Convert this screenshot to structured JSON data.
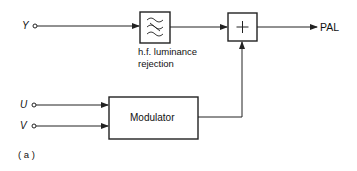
{
  "diagram": {
    "inputs": {
      "y": "Y",
      "u": "U",
      "v": "V"
    },
    "blocks": {
      "filter": {
        "symbol": "filter-icon",
        "caption_line1": "h.f. luminance",
        "caption_line2": "rejection"
      },
      "summer": {
        "symbol": "+"
      },
      "modulator": {
        "label": "Modulator"
      }
    },
    "output": "PAL",
    "figure_label": "( a )",
    "colors": {
      "line": "#222222",
      "background": "#ffffff"
    }
  }
}
